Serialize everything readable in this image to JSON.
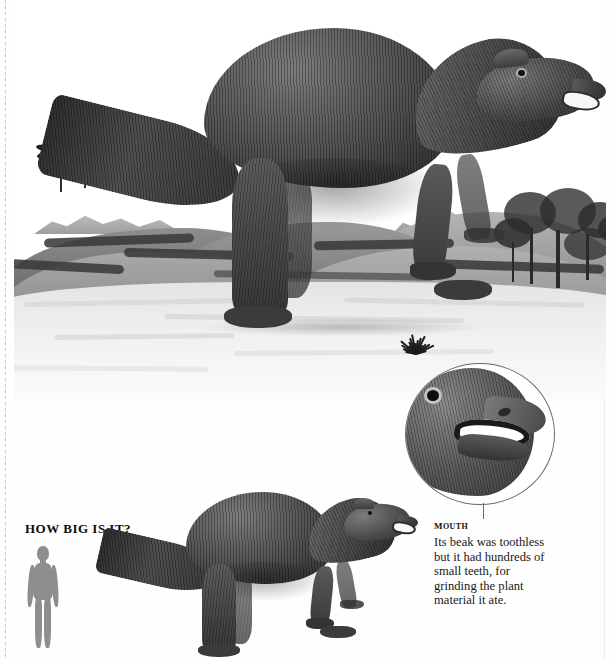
{
  "page": {
    "background_color": "#fefefe",
    "edge_rule_color": "#bdbdbd"
  },
  "main_illustration": {
    "alt": "hadrosaur-engraving",
    "subject": "Hadrosaur (duck-billed dinosaur) standing in a prehistoric landscape",
    "style": "black-and-white engraving",
    "scenery": {
      "palm_trees": "palm-tree-cluster",
      "broadleaf_trees": "broadleaf-tree-cluster",
      "mountains": "distant-mountain-range",
      "shrub": "foreground-shrub"
    }
  },
  "inset": {
    "alt": "mouth-closeup-circle",
    "subject": "Close-up of the hadrosaur head and open beak"
  },
  "callout": {
    "title": "Mouth",
    "body_lines": [
      "Its beak was toothless",
      "but it had hundreds of",
      "small teeth, for",
      "grinding the plant",
      "material it ate."
    ]
  },
  "scale": {
    "title": "HOW BIG IS IT?",
    "human_silhouette": "human-scale-figure",
    "human_color": "#8e8e8e",
    "dinosaur_silhouette": "hadrosaur-scale-figure"
  }
}
